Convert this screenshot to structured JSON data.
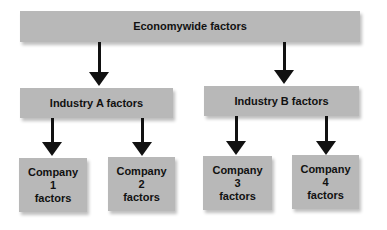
{
  "diagram": {
    "top": {
      "label": "Economywide factors"
    },
    "industries": [
      {
        "label": "Industry A factors"
      },
      {
        "label": "Industry B factors"
      }
    ],
    "companies": [
      {
        "line1": "Company",
        "line2": "1",
        "line3": "factors"
      },
      {
        "line1": "Company",
        "line2": "2",
        "line3": "factors"
      },
      {
        "line1": "Company",
        "line2": "3",
        "line3": "factors"
      },
      {
        "line1": "Company",
        "line2": "4",
        "line3": "factors"
      }
    ],
    "colors": {
      "box": "#b8b8b8",
      "arrow": "#111111",
      "text": "#111111"
    }
  }
}
